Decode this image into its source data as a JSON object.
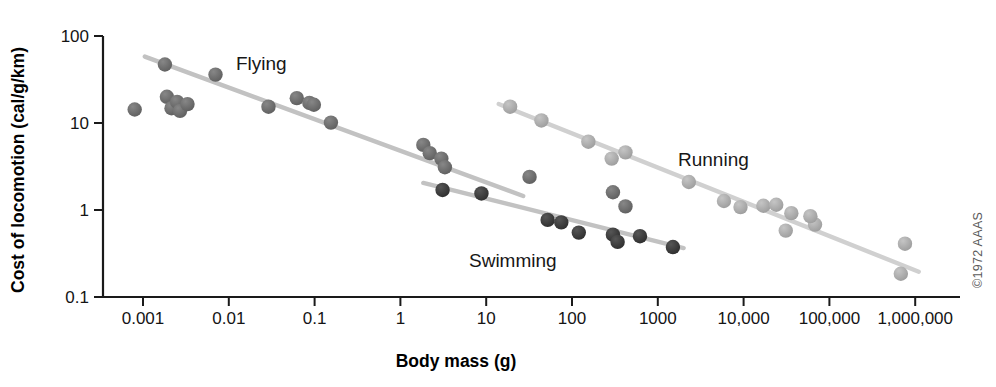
{
  "figure": {
    "credit": "©1972 AAAS"
  },
  "labels": {
    "flying": "Flying",
    "running": "Running",
    "swimming": "Swimming"
  },
  "chart_data": {
    "type": "scatter",
    "title": "",
    "xlabel": "Body mass (g)",
    "ylabel": "Cost of locomotion (cal/g/km)",
    "xscale": "log",
    "yscale": "log",
    "xlim": [
      0.0004,
      3000000
    ],
    "ylim": [
      0.1,
      130
    ],
    "grid": false,
    "legend_position": "inline-annotations",
    "xticks": [
      0.001,
      0.01,
      0.1,
      1,
      10,
      100,
      1000,
      10000,
      100000,
      1000000
    ],
    "xtick_labels": [
      "0.001",
      "0.01",
      "0.1",
      "1",
      "10",
      "100",
      "1000",
      "10,000",
      "100,000",
      "1,000,000"
    ],
    "yticks": [
      0.1,
      1,
      10,
      100
    ],
    "ytick_labels": [
      "0.1",
      "1",
      "10",
      "100"
    ],
    "series": [
      {
        "name": "Flying",
        "color": "#6b6b6b",
        "line_color": "#c2c2c2",
        "marker": "circle",
        "points": [
          {
            "x": 0.0008,
            "y": 14.3
          },
          {
            "x": 0.0018,
            "y": 47.0
          },
          {
            "x": 0.0019,
            "y": 20.0
          },
          {
            "x": 0.00215,
            "y": 14.8
          },
          {
            "x": 0.0025,
            "y": 17.5
          },
          {
            "x": 0.0027,
            "y": 13.8
          },
          {
            "x": 0.0033,
            "y": 16.5
          },
          {
            "x": 0.007,
            "y": 36.0
          },
          {
            "x": 0.029,
            "y": 15.4
          },
          {
            "x": 0.062,
            "y": 19.3
          },
          {
            "x": 0.087,
            "y": 17.0
          },
          {
            "x": 0.098,
            "y": 16.2
          },
          {
            "x": 0.155,
            "y": 10.1
          },
          {
            "x": 1.85,
            "y": 5.6
          },
          {
            "x": 2.2,
            "y": 4.5
          },
          {
            "x": 3.0,
            "y": 3.9
          },
          {
            "x": 3.3,
            "y": 3.1
          },
          {
            "x": 32.0,
            "y": 2.4
          },
          {
            "x": 300.0,
            "y": 1.6
          },
          {
            "x": 420.0,
            "y": 1.1
          }
        ],
        "fit_line": {
          "x1": 0.00105,
          "y1": 58.0,
          "x2": 27.0,
          "y2": 1.45
        }
      },
      {
        "name": "Swimming",
        "color": "#3a3a3a",
        "line_color": "#c2c2c2",
        "marker": "circle",
        "points": [
          {
            "x": 3.1,
            "y": 1.7
          },
          {
            "x": 8.8,
            "y": 1.55
          },
          {
            "x": 52.0,
            "y": 0.77
          },
          {
            "x": 75.0,
            "y": 0.72
          },
          {
            "x": 120.0,
            "y": 0.55
          },
          {
            "x": 300.0,
            "y": 0.52
          },
          {
            "x": 340.0,
            "y": 0.43
          },
          {
            "x": 620.0,
            "y": 0.5
          },
          {
            "x": 1500.0,
            "y": 0.375
          }
        ],
        "fit_line": {
          "x1": 1.85,
          "y1": 2.05,
          "x2": 2000.0,
          "y2": 0.365
        }
      },
      {
        "name": "Running",
        "color": "#a9a9a9",
        "line_color": "#d0d0d0",
        "marker": "circle",
        "points": [
          {
            "x": 19.0,
            "y": 15.4
          },
          {
            "x": 44.0,
            "y": 10.7
          },
          {
            "x": 155.0,
            "y": 6.1
          },
          {
            "x": 290.0,
            "y": 3.9
          },
          {
            "x": 420.0,
            "y": 4.6
          },
          {
            "x": 2300.0,
            "y": 2.1
          },
          {
            "x": 5900.0,
            "y": 1.27
          },
          {
            "x": 9200.0,
            "y": 1.08
          },
          {
            "x": 17000.0,
            "y": 1.12
          },
          {
            "x": 24000.0,
            "y": 1.15
          },
          {
            "x": 36000.0,
            "y": 0.92
          },
          {
            "x": 31000.0,
            "y": 0.58
          },
          {
            "x": 68000.0,
            "y": 0.68
          },
          {
            "x": 60000.0,
            "y": 0.85
          },
          {
            "x": 760000.0,
            "y": 0.41
          },
          {
            "x": 680000.0,
            "y": 0.185
          }
        ],
        "fit_line": {
          "x1": 14.0,
          "y1": 16.5,
          "x2": 1100000.0,
          "y2": 0.195
        }
      }
    ]
  }
}
